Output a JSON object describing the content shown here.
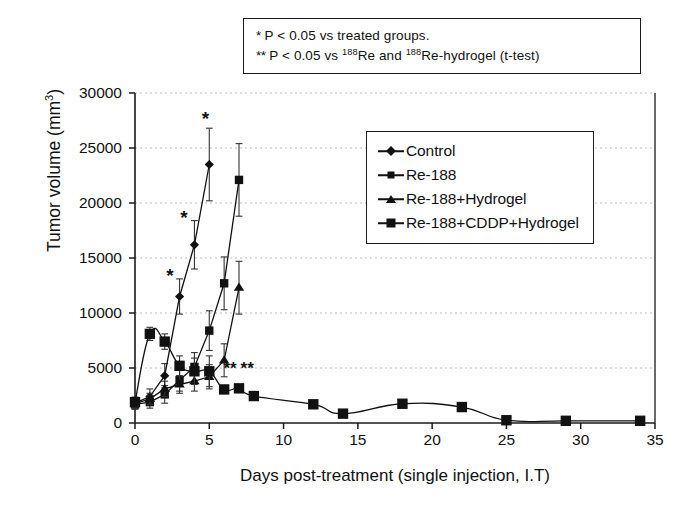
{
  "annotation": {
    "line1_star": "*",
    "line1_text": " P < 0.05 vs treated groups.",
    "line2_star": "**",
    "line2_a": " P < 0.05 vs ",
    "line2_sup1": "188",
    "line2_b": "Re and ",
    "line2_sup2": "188",
    "line2_c": "Re-hydrogel (t-test)"
  },
  "axes": {
    "y_title_main": "Tumor volume (mm",
    "y_title_sup": "3",
    "y_title_end": ")",
    "x_title": "Days post-treatment (single injection, I.T)",
    "y_ticks": [
      "0",
      "5000",
      "10000",
      "15000",
      "20000",
      "25000",
      "30000"
    ],
    "x_ticks": [
      "0",
      "5",
      "10",
      "15",
      "20",
      "25",
      "30",
      "35"
    ]
  },
  "legend": {
    "items": [
      {
        "label": "Control",
        "marker": "diamond-marker"
      },
      {
        "label": "Re-188",
        "marker": "small-square-marker"
      },
      {
        "label": "Re-188+Hydrogel",
        "marker": "triangle-marker"
      },
      {
        "label": "Re-188+CDDP+Hydrogel",
        "marker": "large-square-marker"
      }
    ]
  },
  "chart_data": {
    "type": "line",
    "title": "",
    "xlabel": "Days post-treatment (single injection, I.T)",
    "ylabel": "Tumor volume (mm3)",
    "xlim": [
      0,
      35
    ],
    "ylim": [
      0,
      30000
    ],
    "xticks": [
      0,
      5,
      10,
      15,
      20,
      25,
      30,
      35
    ],
    "yticks": [
      0,
      5000,
      10000,
      15000,
      20000,
      25000,
      30000
    ],
    "grid": "horizontal-dotted",
    "legend_position": "upper-right-inside",
    "error_bars": "standard-deviation",
    "series": [
      {
        "name": "Control",
        "marker": "diamond",
        "x": [
          0,
          1,
          2,
          3,
          4,
          5
        ],
        "y": [
          1800,
          2400,
          4300,
          11500,
          16200,
          23500
        ],
        "yerr": [
          500,
          700,
          1100,
          1600,
          2200,
          3300
        ]
      },
      {
        "name": "Re-188",
        "marker": "small-square",
        "x": [
          0,
          1,
          2,
          3,
          4,
          5,
          6,
          7
        ],
        "y": [
          1700,
          1900,
          2600,
          3900,
          5100,
          8400,
          12700,
          22100
        ],
        "yerr": [
          450,
          550,
          800,
          1000,
          1300,
          1800,
          2400,
          3300
        ]
      },
      {
        "name": "Re-188+Hydrogel",
        "marker": "triangle",
        "x": [
          0,
          1,
          2,
          3,
          4,
          5,
          6,
          7
        ],
        "y": [
          1750,
          2200,
          3100,
          3500,
          3800,
          4200,
          5700,
          12300
        ],
        "yerr": [
          400,
          500,
          700,
          800,
          900,
          1100,
          1500,
          2400
        ]
      },
      {
        "name": "Re-188+CDDP+Hydrogel",
        "marker": "large-square",
        "x": [
          0,
          1,
          2,
          3,
          4,
          5,
          6,
          7,
          8,
          12,
          14,
          18,
          22,
          25,
          29,
          34
        ],
        "y": [
          1900,
          8100,
          7400,
          5200,
          4700,
          4700,
          3050,
          3150,
          2450,
          1700,
          850,
          1750,
          1450,
          250,
          200,
          200
        ],
        "yerr": [
          450,
          600,
          700,
          900,
          1200,
          1400,
          350,
          350,
          300,
          250,
          200,
          150,
          180,
          150,
          80,
          80
        ]
      }
    ],
    "significance_markers": [
      {
        "symbol": "*",
        "x": 2.35,
        "y": 12800
      },
      {
        "symbol": "*",
        "x": 3.3,
        "y": 18100
      },
      {
        "symbol": "*",
        "x": 4.75,
        "y": 27100
      },
      {
        "symbol": "**",
        "x": 6.4,
        "y": 4450
      },
      {
        "symbol": "**",
        "x": 7.55,
        "y": 4450
      }
    ]
  }
}
